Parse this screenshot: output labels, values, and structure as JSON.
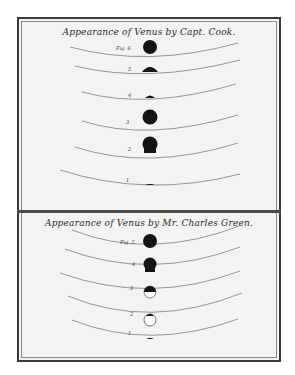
{
  "plate": {
    "border_color": "#3a3a3a",
    "paper_color": "#f3f3f1",
    "ink_color": "#1a1a1a"
  },
  "panels": [
    {
      "title": "Appearance of Venus by Capt. Cook.",
      "figures": [
        {
          "label": "Fig. 6",
          "phase": "full-dark-above"
        },
        {
          "label": "5",
          "phase": "half-dark-cap"
        },
        {
          "label": "4",
          "phase": "small-dark-cap"
        },
        {
          "label": "3",
          "phase": "full-dark-above"
        },
        {
          "label": "2",
          "phase": "full-dark-touching"
        },
        {
          "label": "1",
          "phase": "sliver"
        }
      ]
    },
    {
      "title": "Appearance of Venus by Mr. Charles Green.",
      "figures": [
        {
          "label": "Fig. 5",
          "phase": "full-dark-above"
        },
        {
          "label": "4",
          "phase": "full-dark-touching"
        },
        {
          "label": "3",
          "phase": "half-dark-half-open"
        },
        {
          "label": "2",
          "phase": "open-ring-dark-cap"
        },
        {
          "label": "1",
          "phase": "sliver"
        }
      ]
    }
  ]
}
